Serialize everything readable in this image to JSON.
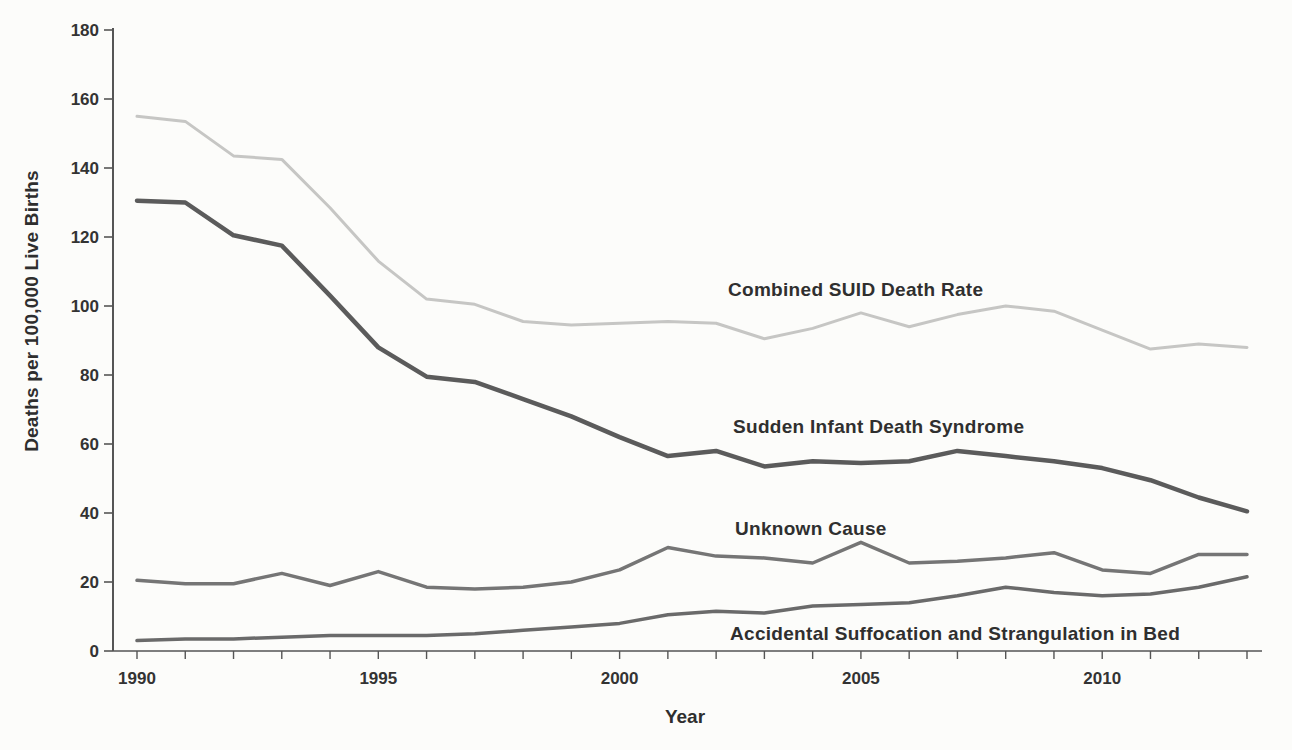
{
  "chart_data": {
    "type": "line",
    "title": "",
    "xlabel": "Year",
    "ylabel": "Deaths per 100,000 Live Births",
    "x": [
      1990,
      1991,
      1992,
      1993,
      1994,
      1995,
      1996,
      1997,
      1998,
      1999,
      2000,
      2001,
      2002,
      2003,
      2004,
      2005,
      2006,
      2007,
      2008,
      2009,
      2010,
      2011,
      2012,
      2013
    ],
    "x_labeled_ticks": [
      1990,
      1995,
      2000,
      2005,
      2010
    ],
    "y_ticks": [
      0,
      20,
      40,
      60,
      80,
      100,
      120,
      140,
      160,
      180
    ],
    "ylim": [
      0,
      180
    ],
    "grid": "off",
    "legend": "inline-annotations",
    "series": [
      {
        "name": "Combined SUID Death Rate",
        "color": "#c6c6c4",
        "stroke_width": 3,
        "values": [
          155,
          153.5,
          143.5,
          142.5,
          128.5,
          113,
          102,
          100.5,
          95.5,
          94.5,
          95,
          95.5,
          95,
          90.5,
          93.5,
          98,
          94,
          97.5,
          100,
          98.5,
          93,
          87.5,
          89,
          88
        ]
      },
      {
        "name": "Sudden Infant Death Syndrome",
        "color": "#5b5b5b",
        "stroke_width": 4.5,
        "values": [
          130.5,
          130,
          120.5,
          117.5,
          103,
          88,
          79.5,
          78,
          73,
          68,
          62,
          56.5,
          58,
          53.5,
          55,
          54.5,
          55,
          58,
          56.5,
          55,
          53,
          49.5,
          44.5,
          40.5
        ]
      },
      {
        "name": "Unknown Cause",
        "color": "#757575",
        "stroke_width": 3.5,
        "values": [
          20.5,
          19.5,
          19.5,
          22.5,
          19,
          23,
          18.5,
          18,
          18.5,
          20,
          23.5,
          30,
          27.5,
          27,
          25.5,
          31.5,
          25.5,
          26,
          27,
          28.5,
          23.5,
          22.5,
          28,
          28
        ]
      },
      {
        "name": "Accidental Suffocation and Strangulation in Bed",
        "color": "#6a6a6a",
        "stroke_width": 3.5,
        "values": [
          3,
          3.5,
          3.5,
          4,
          4.5,
          4.5,
          4.5,
          5,
          6,
          7,
          8,
          10.5,
          11.5,
          11,
          13,
          13.5,
          14,
          16,
          18.5,
          17,
          16,
          16.5,
          18.5,
          21.5
        ]
      }
    ],
    "axis_color": "#555555",
    "tick_label_color": "#333333"
  }
}
